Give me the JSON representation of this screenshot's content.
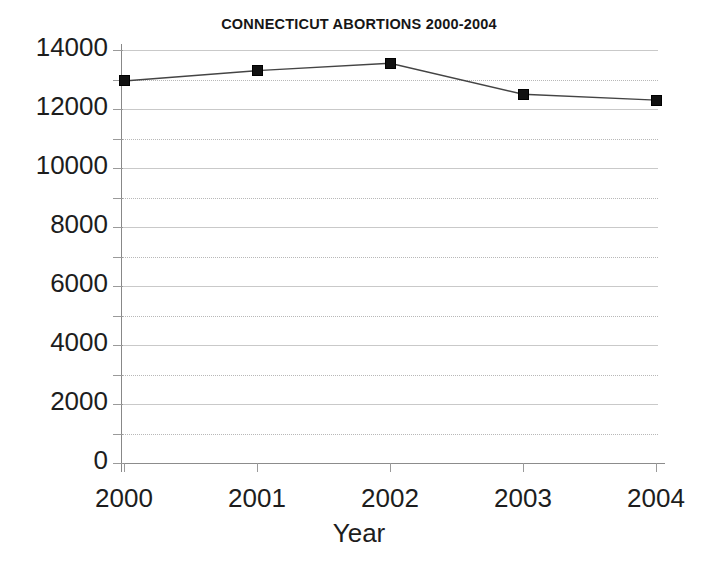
{
  "chart_data": {
    "type": "line",
    "title": "CONNECTICUT ABORTIONS 2000-2004",
    "xlabel": "Year",
    "ylabel": "",
    "categories": [
      "2000",
      "2001",
      "2002",
      "2003",
      "2004"
    ],
    "x": [
      2000,
      2001,
      2002,
      2003,
      2004
    ],
    "values": [
      12950,
      13300,
      13550,
      12500,
      12300
    ],
    "series": [
      {
        "name": "Abortions",
        "values": [
          12950,
          13300,
          13550,
          12500,
          12300
        ]
      }
    ],
    "ylim": [
      0,
      14000
    ],
    "ytick_values": [
      0,
      2000,
      4000,
      6000,
      8000,
      10000,
      12000,
      14000
    ],
    "ytick_labels": [
      "0",
      "2000",
      "4000",
      "6000",
      "8000",
      "10000",
      "12000",
      "14000"
    ],
    "yminor_values": [
      1000,
      3000,
      5000,
      7000,
      9000,
      11000,
      13000
    ],
    "xtick_labels": [
      "2000",
      "2001",
      "2002",
      "2003",
      "2004"
    ],
    "grid": "major solid, minor dotted, horizontal only",
    "legend": "none",
    "marker_style": "filled square",
    "line_color": "#444444",
    "marker_color": "#111111",
    "grid_color": "#c9c9c9",
    "axis_color": "#8c8c8c",
    "background": "#ffffff"
  }
}
